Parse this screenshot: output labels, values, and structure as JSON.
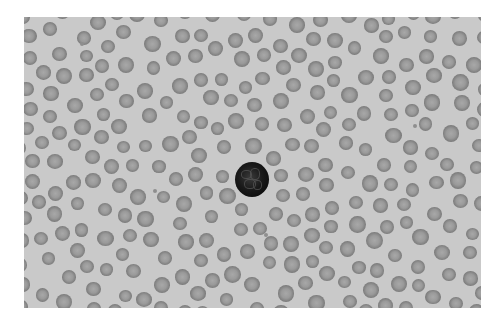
{
  "image": {
    "subject": "peripheral blood smear micrograph",
    "background_color": "#c9c9c9",
    "border_color": "#ffffff",
    "field": {
      "x": 24,
      "y": 17,
      "width": 457,
      "height": 291
    }
  },
  "wbc": {
    "label": "white blood cell (lymphocyte)",
    "cx": 252,
    "cy": 179,
    "r": 17
  },
  "rbc": {
    "label": "red blood cells",
    "count_approx": 300,
    "diameter_range": [
      13,
      17
    ],
    "seed": 7
  },
  "platelets": [
    [
      82,
      44
    ],
    [
      266,
      235
    ],
    [
      155,
      191
    ],
    [
      415,
      126
    ]
  ]
}
